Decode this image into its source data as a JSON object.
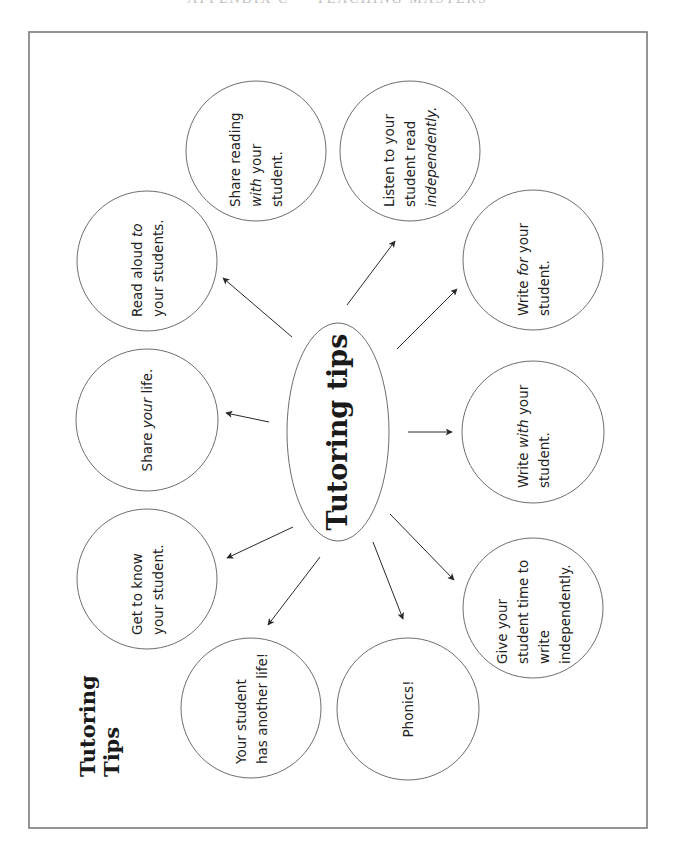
{
  "page": {
    "header": "APPENDIX C — TEACHING MASTERS"
  },
  "diagram": {
    "title": {
      "line1": "Tutoring",
      "line2": "Tips"
    },
    "hub": {
      "label": "Tutoring tips"
    },
    "tips": [
      {
        "id": "read-aloud",
        "lines": [
          [
            {
              "t": "Read aloud "
            },
            {
              "t": "to",
              "em": true
            }
          ],
          [
            {
              "t": "your students."
            }
          ]
        ]
      },
      {
        "id": "share-reading",
        "lines": [
          [
            {
              "t": "Share reading"
            }
          ],
          [
            {
              "t": "with",
              "em": true
            },
            {
              "t": " your"
            }
          ],
          [
            {
              "t": "student."
            }
          ]
        ]
      },
      {
        "id": "listen",
        "lines": [
          [
            {
              "t": "Listen to your"
            }
          ],
          [
            {
              "t": "student read"
            }
          ],
          [
            {
              "t": "independently.",
              "em": true
            }
          ]
        ]
      },
      {
        "id": "write-for",
        "lines": [
          [
            {
              "t": "Write "
            },
            {
              "t": "for",
              "em": true
            },
            {
              "t": " your"
            }
          ],
          [
            {
              "t": "student."
            }
          ]
        ]
      },
      {
        "id": "write-with",
        "lines": [
          [
            {
              "t": "Write "
            },
            {
              "t": "with",
              "em": true
            },
            {
              "t": " your"
            }
          ],
          [
            {
              "t": "student."
            }
          ]
        ]
      },
      {
        "id": "give-time",
        "lines": [
          [
            {
              "t": "Give your"
            }
          ],
          [
            {
              "t": "student time to"
            }
          ],
          [
            {
              "t": "write"
            }
          ],
          [
            {
              "t": "independently."
            }
          ]
        ]
      },
      {
        "id": "phonics",
        "lines": [
          [
            {
              "t": "Phonics!"
            }
          ]
        ]
      },
      {
        "id": "another-life",
        "lines": [
          [
            {
              "t": "Your student"
            }
          ],
          [
            {
              "t": "has another life!"
            }
          ]
        ]
      },
      {
        "id": "get-to-know",
        "lines": [
          [
            {
              "t": "Get to know"
            }
          ],
          [
            {
              "t": "your student."
            }
          ]
        ]
      },
      {
        "id": "share-life",
        "lines": [
          [
            {
              "t": "Share "
            },
            {
              "t": "your",
              "em": true
            },
            {
              "t": " life."
            }
          ]
        ]
      }
    ],
    "text_orientation": "rotated 90° counter-clockwise",
    "colors": {
      "outline": "#6e6e6e",
      "arrow": "#2a2a2a",
      "text": "#222222",
      "background": "#ffffff"
    }
  }
}
